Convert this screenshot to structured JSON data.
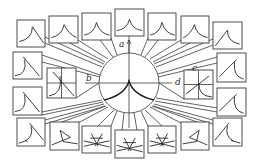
{
  "diagram": {
    "title": "",
    "colors": {
      "line": "#3a3a3a",
      "background": "#ffffff"
    },
    "center_circle": {
      "cx": 129,
      "cy": 83,
      "r": 30
    },
    "axes": {
      "vertical": {
        "x": 129,
        "y1": 40,
        "y2": 128,
        "arrow": "up",
        "label": "a",
        "label_x": 119,
        "label_y": 47
      },
      "horizontal": {
        "y": 83,
        "x1": 85,
        "x2": 172
      }
    },
    "labels": [
      {
        "id": "a",
        "text": "a",
        "x": 119,
        "y": 47
      },
      {
        "id": "b",
        "text": "b",
        "x": 86,
        "y": 81
      },
      {
        "id": "c",
        "text": "c",
        "x": 192,
        "y": 71
      },
      {
        "id": "d",
        "text": "d",
        "x": 175,
        "y": 85
      }
    ],
    "insets": [
      {
        "id": "inset-left",
        "x": 47,
        "y": 68,
        "w": 29,
        "h": 30,
        "cross": true,
        "curve": "left-inset",
        "connect_to": [
          99,
          83
        ]
      },
      {
        "id": "inset-right",
        "x": 184,
        "y": 70,
        "w": 29,
        "h": 29,
        "cross": true,
        "curve": "right-inset",
        "connect_to": [
          159,
          83
        ]
      }
    ],
    "boxes": [
      {
        "id": "top-1",
        "x": 17,
        "y": 20,
        "w": 28,
        "h": 27,
        "curve": "cusp-right"
      },
      {
        "id": "top-2",
        "x": 49,
        "y": 16,
        "w": 29,
        "h": 27,
        "curve": "cusp-mid-right"
      },
      {
        "id": "top-3",
        "x": 82,
        "y": 13,
        "w": 29,
        "h": 27,
        "curve": "cusp-mid"
      },
      {
        "id": "top-4",
        "x": 115,
        "y": 9,
        "w": 29,
        "h": 27,
        "curve": "cusp-sym"
      },
      {
        "id": "top-5",
        "x": 148,
        "y": 13,
        "w": 28,
        "h": 27,
        "curve": "cusp-mid"
      },
      {
        "id": "top-6",
        "x": 181,
        "y": 16,
        "w": 28,
        "h": 27,
        "curve": "cusp-mid-left"
      },
      {
        "id": "top-7",
        "x": 213,
        "y": 22,
        "w": 29,
        "h": 27,
        "curve": "cusp-left"
      },
      {
        "id": "left-1",
        "x": 13,
        "y": 52,
        "w": 29,
        "h": 27,
        "curve": "fold-left"
      },
      {
        "id": "left-2",
        "x": 13,
        "y": 87,
        "w": 29,
        "h": 28,
        "curve": "fold-left"
      },
      {
        "id": "right-1",
        "x": 217,
        "y": 53,
        "w": 29,
        "h": 29,
        "curve": "fold-right"
      },
      {
        "id": "right-2",
        "x": 217,
        "y": 88,
        "w": 29,
        "h": 28,
        "curve": "fold-right"
      },
      {
        "id": "bottom-1",
        "x": 17,
        "y": 118,
        "w": 28,
        "h": 28,
        "curve": "swallow-1"
      },
      {
        "id": "bottom-2",
        "x": 50,
        "y": 122,
        "w": 29,
        "h": 28,
        "curve": "swallow-2"
      },
      {
        "id": "bottom-3",
        "x": 82,
        "y": 126,
        "w": 29,
        "h": 27,
        "curve": "star"
      },
      {
        "id": "bottom-4",
        "x": 115,
        "y": 130,
        "w": 29,
        "h": 28,
        "curve": "star"
      },
      {
        "id": "bottom-5",
        "x": 148,
        "y": 126,
        "w": 28,
        "h": 27,
        "curve": "star"
      },
      {
        "id": "bottom-6",
        "x": 181,
        "y": 122,
        "w": 28,
        "h": 28,
        "curve": "swallow-2r"
      },
      {
        "id": "bottom-7",
        "x": 213,
        "y": 118,
        "w": 29,
        "h": 28,
        "curve": "swallow-1r"
      }
    ],
    "connectors": [
      {
        "from": "top-1",
        "pts": [
          [
            45,
            37
          ],
          [
            104,
            64
          ]
        ],
        "pts2": [
          [
            45,
            43
          ],
          [
            102,
            67
          ]
        ]
      },
      {
        "from": "top-2",
        "pts": [
          [
            78,
            40
          ],
          [
            108,
            59
          ]
        ],
        "pts2": [
          [
            70,
            43
          ],
          [
            105,
            62
          ]
        ]
      },
      {
        "from": "top-3",
        "pts": [
          [
            111,
            38
          ],
          [
            117,
            55
          ]
        ],
        "pts2": [
          [
            100,
            40
          ],
          [
            113,
            57
          ]
        ]
      },
      {
        "from": "top-4",
        "pts": [
          [
            129,
            36
          ],
          [
            129,
            53
          ]
        ]
      },
      {
        "from": "top-5",
        "pts": [
          [
            148,
            38
          ],
          [
            141,
            55
          ]
        ],
        "pts2": [
          [
            158,
            40
          ],
          [
            145,
            57
          ]
        ]
      },
      {
        "from": "top-6",
        "pts": [
          [
            181,
            40
          ],
          [
            150,
            59
          ]
        ],
        "pts2": [
          [
            190,
            43
          ],
          [
            153,
            62
          ]
        ]
      },
      {
        "from": "top-7",
        "pts": [
          [
            213,
            39
          ],
          [
            154,
            64
          ]
        ],
        "pts2": [
          [
            213,
            45
          ],
          [
            156,
            67
          ]
        ]
      },
      {
        "from": "left-1",
        "pts": [
          [
            42,
            55
          ],
          [
            100,
            75
          ]
        ],
        "pts2": [
          [
            42,
            62
          ],
          [
            100,
            77
          ]
        ]
      },
      {
        "from": "left-2",
        "pts": [
          [
            42,
            112
          ],
          [
            102,
            100
          ]
        ],
        "pts2": [
          [
            42,
            115
          ],
          [
            103,
            102
          ]
        ]
      },
      {
        "from": "right-1",
        "pts": [
          [
            217,
            57
          ],
          [
            158,
            74
          ]
        ],
        "pts2": [
          [
            217,
            63
          ],
          [
            158,
            77
          ]
        ]
      },
      {
        "from": "right-2",
        "pts": [
          [
            217,
            108
          ],
          [
            156,
            98
          ]
        ],
        "pts2": [
          [
            217,
            112
          ],
          [
            155,
            101
          ]
        ]
      },
      {
        "from": "bottom-1",
        "pts": [
          [
            45,
            120
          ],
          [
            104,
            104
          ]
        ],
        "pts2": [
          [
            45,
            124
          ],
          [
            105,
            106
          ]
        ]
      },
      {
        "from": "bottom-2",
        "pts": [
          [
            78,
            123
          ],
          [
            108,
            107
          ]
        ],
        "pts2": [
          [
            62,
            122
          ],
          [
            106,
            106
          ]
        ]
      },
      {
        "from": "bottom-3",
        "pts": [
          [
            111,
            126
          ],
          [
            117,
            111
          ]
        ],
        "pts2": [
          [
            98,
            126
          ],
          [
            114,
            110
          ]
        ]
      },
      {
        "from": "bottom-4",
        "pts": [
          [
            122,
            130
          ],
          [
            124,
            113
          ]
        ],
        "pts2": [
          [
            137,
            130
          ],
          [
            134,
            113
          ]
        ]
      },
      {
        "from": "bottom-5",
        "pts": [
          [
            148,
            126
          ],
          [
            141,
            111
          ]
        ],
        "pts2": [
          [
            162,
            126
          ],
          [
            145,
            110
          ]
        ]
      },
      {
        "from": "bottom-6",
        "pts": [
          [
            181,
            123
          ],
          [
            150,
            107
          ]
        ],
        "pts2": [
          [
            197,
            122
          ],
          [
            152,
            106
          ]
        ]
      },
      {
        "from": "bottom-7",
        "pts": [
          [
            213,
            120
          ],
          [
            154,
            104
          ]
        ],
        "pts2": [
          [
            213,
            124
          ],
          [
            153,
            106
          ]
        ]
      }
    ]
  }
}
